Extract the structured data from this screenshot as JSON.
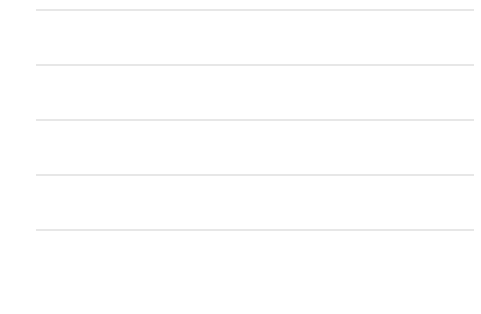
{
  "chart_data": {
    "type": "line",
    "title": "",
    "xlabel": "",
    "ylabel": "",
    "xlim": [
      2000,
      2017.4
    ],
    "ylim": [
      0,
      100
    ],
    "grid": true,
    "gridlines_y": [
      20,
      40,
      60,
      80,
      100
    ],
    "y_ticks": [
      "0",
      "20",
      "40",
      "60",
      "80",
      "100"
    ],
    "y_tick_values": [
      0,
      20,
      40,
      60,
      80,
      100
    ],
    "x_ticks": [
      "2002",
      "2004",
      "2006",
      "2008",
      "2010",
      "2012",
      "2014",
      "2016"
    ],
    "x_tick_values": [
      2002,
      2004,
      2006,
      2008,
      2010,
      2012,
      2014,
      2016
    ],
    "legend_position": "top-left-inside",
    "series": [
      {
        "name": "Silent Generation (1928–45)",
        "color": "#b9b9b9",
        "width": 1.4,
        "x": [
          2000,
          2001,
          2002,
          2003,
          2004,
          2005,
          2006,
          2007,
          2008,
          2009,
          2010,
          2011,
          2012,
          2013,
          2014,
          2015,
          2016,
          2017
        ],
        "values": [
          22,
          21,
          19,
          17.5,
          18,
          19,
          19.5,
          20,
          21.5,
          20,
          25,
          26,
          23,
          24,
          31,
          31,
          30.5,
          40.5
        ]
      },
      {
        "name": "Generation X (1965–80)",
        "color": "#b0b0b0",
        "width": 1.6,
        "x": [
          2000,
          2001,
          2002,
          2003,
          2004,
          2005,
          2006,
          2007,
          2008,
          2009,
          2010,
          2011,
          2012,
          2013,
          2014,
          2015,
          2016,
          2017
        ],
        "values": [
          50,
          49,
          46,
          41,
          40,
          43,
          44,
          44.5,
          45,
          41,
          45,
          47.5,
          48,
          49,
          52,
          58,
          55,
          65
        ]
      },
      {
        "name": "Baby Boomers (1946–64)",
        "color": "#8c8c8c",
        "width": 1.8,
        "x": [
          2000,
          2001,
          2002,
          2003,
          2004,
          2005,
          2006,
          2007,
          2008,
          2009,
          2010,
          2011,
          2012,
          2013,
          2014,
          2015,
          2016,
          2017
        ],
        "values": [
          32.5,
          32.5,
          33,
          34,
          34.5,
          32,
          34,
          35,
          35,
          32,
          37.5,
          39.5,
          39,
          39.5,
          40,
          45,
          45,
          56
        ]
      },
      {
        "name": "Millennials (1981 or later)",
        "color": "#3b3b3b",
        "width": 2.4,
        "x": [
          2003,
          2004,
          2005,
          2006,
          2007,
          2008,
          2009,
          2010,
          2011,
          2012,
          2013,
          2014,
          2015,
          2016,
          2017
        ],
        "values": [
          51.5,
          44.5,
          48.5,
          49.5,
          51.5,
          53,
          51,
          54.5,
          61,
          63.5,
          65,
          67,
          70,
          71.5,
          74
        ]
      }
    ]
  },
  "legend": {
    "items": [
      {
        "label": "Silent Generation (1928–45)",
        "color": "#b9b9b9"
      },
      {
        "label": "Baby Boomers (1946–64)",
        "color": "#8c8c8c"
      },
      {
        "label": "Generation X (1965–80)",
        "color": "#b0b0b0"
      },
      {
        "label": "Millennials (1981 or later)",
        "color": "#3b3b3b"
      }
    ]
  }
}
